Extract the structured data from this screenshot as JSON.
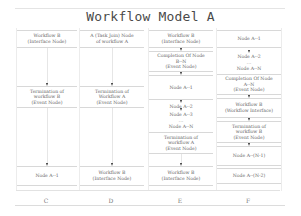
{
  "title": "Workflow Model A",
  "columns": [
    {
      "label": "C",
      "nodes": [
        {
          "lines": [
            "Workflow B",
            "(Interface Node)"
          ]
        },
        {
          "lines": [
            "Termination of",
            "workflow B",
            "(Event Node)"
          ]
        },
        {
          "lines": [
            "Node A--1"
          ]
        }
      ]
    },
    {
      "label": "D",
      "nodes": [
        {
          "lines": [
            "A (Task Join) Node",
            "of workflow A"
          ]
        },
        {
          "lines": [
            "Termination of",
            "Workflow A",
            "(Event Node)"
          ]
        },
        {
          "lines": [
            "Workflow B",
            "(Interface Node)"
          ]
        }
      ]
    },
    {
      "label": "E",
      "nodes": [
        {
          "lines": [
            "Workflow B",
            "(Interface Node)"
          ]
        },
        {
          "lines": [
            "Completion Of Node",
            "B--N",
            "(Event Node)"
          ]
        },
        {
          "lines": [
            "Node A--1"
          ]
        },
        {
          "lines": [
            "Node A--2"
          ]
        },
        {
          "lines": [
            "Node A--3"
          ]
        },
        {
          "lines": [
            "..."
          ]
        },
        {
          "lines": [
            "Node A--N"
          ]
        },
        {
          "lines": [
            "Termination of",
            "workflow A",
            "(Event Node)"
          ]
        },
        {
          "lines": [
            "Workflow B",
            "(Interface Node)"
          ]
        }
      ]
    },
    {
      "label": "F",
      "nodes": [
        {
          "lines": [
            "Node A--1"
          ]
        },
        {
          "lines": [
            "Node A--2"
          ]
        },
        {
          "lines": [
            "..."
          ]
        },
        {
          "lines": [
            "Node A--N"
          ]
        },
        {
          "lines": [
            "Completion Of Node",
            "A--N",
            "(Event Node)"
          ]
        },
        {
          "lines": [
            "Workflow B",
            "(Workflow Interface)"
          ]
        },
        {
          "lines": [
            "Termination of",
            "workflow B",
            "(Event Node)"
          ]
        },
        {
          "lines": [
            "Node A--(N-1)"
          ]
        },
        {
          "lines": [
            "Node A--(N-2)"
          ]
        }
      ]
    }
  ]
}
